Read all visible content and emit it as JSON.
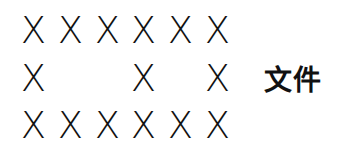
{
  "grid": {
    "glyph": "X",
    "rows": [
      [
        1,
        1,
        1,
        1,
        1,
        1
      ],
      [
        1,
        0,
        0,
        1,
        0,
        1
      ],
      [
        1,
        1,
        1,
        1,
        1,
        1
      ]
    ]
  },
  "label": "文件"
}
